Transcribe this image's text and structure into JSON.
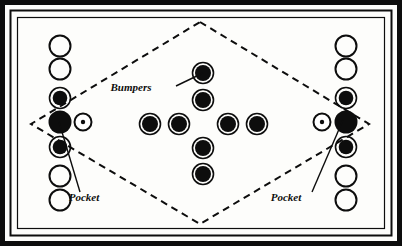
{
  "diagram": {
    "background_color": "#fdfdfb",
    "ink_color": "#0d0d0d",
    "frame": {
      "name": "table-frame",
      "rings": [
        {
          "name": "outer-border",
          "x": 2.5,
          "y": 2.5,
          "w": 397,
          "h": 241,
          "stroke": 5
        },
        {
          "name": "middle-border",
          "x": 10.5,
          "y": 10.5,
          "w": 381,
          "h": 225,
          "stroke": 2
        },
        {
          "name": "inner-border",
          "x": 17.5,
          "y": 17.5,
          "w": 367,
          "h": 211,
          "stroke": 1.2
        }
      ]
    },
    "playfield": {
      "name": "dashed-diamond",
      "points": "200,22 369,124 200,224 31,124",
      "dash": "7 5",
      "stroke": 2
    },
    "labels": [
      {
        "id": "bumpers",
        "text": "Bumpers",
        "x": 131,
        "y": 91,
        "leader": "176,86 203,73"
      },
      {
        "id": "pocket-left",
        "text": "Pocket",
        "x": 84,
        "y": 201,
        "leader": "80,192 59,122"
      },
      {
        "id": "pocket-right",
        "text": "Pocket",
        "x": 286,
        "y": 201,
        "leader": "312,192 343,120"
      }
    ],
    "left_column": {
      "name": "left-ball-column",
      "cx": 60,
      "items": [
        {
          "cy": 46,
          "r": 10.5,
          "style": "outline"
        },
        {
          "cy": 69,
          "r": 10.5,
          "style": "outline"
        },
        {
          "cy": 98,
          "r": 10.5,
          "style": "ringed"
        },
        {
          "cy": 122,
          "r": 11.5,
          "style": "solid",
          "role": "pocket"
        },
        {
          "cy": 147,
          "r": 10.5,
          "style": "ringed"
        },
        {
          "cy": 176,
          "r": 10.5,
          "style": "outline"
        },
        {
          "cy": 200,
          "r": 10.5,
          "style": "outline"
        }
      ],
      "ball": {
        "name": "cue-ball-left",
        "cx": 83,
        "cy": 122,
        "r": 8.5,
        "dot": 2.2
      }
    },
    "right_column": {
      "name": "right-ball-column",
      "cx": 346,
      "items": [
        {
          "cy": 46,
          "r": 10.5,
          "style": "outline"
        },
        {
          "cy": 69,
          "r": 10.5,
          "style": "outline"
        },
        {
          "cy": 98,
          "r": 10.5,
          "style": "ringed"
        },
        {
          "cy": 122,
          "r": 11.5,
          "style": "solid",
          "role": "pocket"
        },
        {
          "cy": 147,
          "r": 10.5,
          "style": "ringed"
        },
        {
          "cy": 176,
          "r": 10.5,
          "style": "outline"
        },
        {
          "cy": 200,
          "r": 10.5,
          "style": "outline"
        }
      ],
      "ball": {
        "name": "cue-ball-right",
        "cx": 322,
        "cy": 122,
        "r": 8.5,
        "dot": 2.2
      }
    },
    "bumpers": {
      "name": "bumper-cluster",
      "shape": "cross",
      "r_outer": 10.5,
      "r_inner": 8.0,
      "items": [
        {
          "id": "bumper-top",
          "cx": 203,
          "cy": 73
        },
        {
          "id": "bumper-upper-mid",
          "cx": 203,
          "cy": 100
        },
        {
          "id": "bumper-left-outer",
          "cx": 150,
          "cy": 124
        },
        {
          "id": "bumper-left-inner",
          "cx": 179,
          "cy": 124
        },
        {
          "id": "bumper-right-inner",
          "cx": 228,
          "cy": 124
        },
        {
          "id": "bumper-right-outer",
          "cx": 257,
          "cy": 124
        },
        {
          "id": "bumper-lower-mid",
          "cx": 203,
          "cy": 148
        },
        {
          "id": "bumper-bottom",
          "cx": 203,
          "cy": 174
        }
      ]
    }
  }
}
